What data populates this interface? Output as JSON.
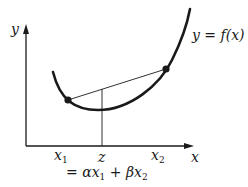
{
  "diagram": {
    "axes": {
      "x_label": "x",
      "y_label": "y"
    },
    "curve_label": "y = f(x)",
    "points": [
      {
        "name": "x1",
        "label": "x",
        "sub": "1"
      },
      {
        "name": "x2",
        "label": "x",
        "sub": "2"
      }
    ],
    "z_label": "z",
    "z_formula": {
      "prefix": "= αx",
      "sub1": "1",
      "mid": " + βx",
      "sub2": "2"
    },
    "colors": {
      "ink": "#1a1a1a",
      "background": "#ffffff"
    }
  }
}
